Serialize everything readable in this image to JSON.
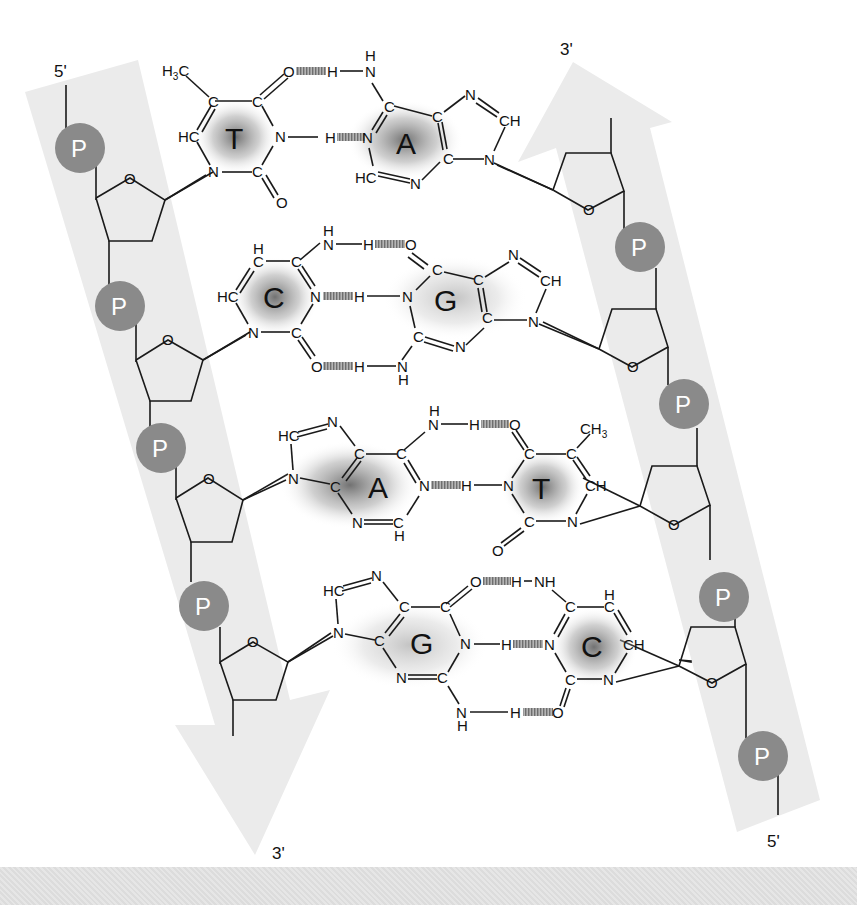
{
  "diagram": {
    "type": "DNA double helix base-pair structure",
    "colors": {
      "strand_band": "#e9e9e9",
      "phosphate": "#8a8a8a",
      "phosphate_text": "#ffffff",
      "bond": "#1a1a1a",
      "hbond": "#9a9a9a",
      "base_shading": "#707070"
    },
    "left_strand": {
      "top_label": "5'",
      "bottom_label": "3'",
      "direction": "down",
      "phosphate_label": "P",
      "phosphates": [
        "P",
        "P",
        "P",
        "P"
      ],
      "sugar_oxygen": "O"
    },
    "right_strand": {
      "top_label": "3'",
      "bottom_label": "5'",
      "direction": "up",
      "phosphate_label": "P",
      "phosphates": [
        "P",
        "P",
        "P",
        "P"
      ],
      "sugar_oxygen": "O"
    },
    "base_pairs": [
      {
        "left": "T",
        "right": "A",
        "left_atoms": {
          "methyl": "H3C",
          "c5": "C",
          "c4": "C",
          "n3": "N",
          "c2": "C",
          "n1": "N",
          "c6": "HC",
          "o4": "O",
          "o2": "O"
        },
        "right_atoms": {
          "n6h": "H",
          "n6": "N",
          "c6": "C",
          "n1": "N",
          "c2": "HC",
          "n3": "N",
          "c4": "C",
          "c5": "C",
          "n7": "N",
          "c8": "CH",
          "n9": "N"
        },
        "hbond_h": [
          "H",
          "H"
        ]
      },
      {
        "left": "C",
        "right": "G",
        "left_atoms": {
          "c5h": "H",
          "c5": "C",
          "c4": "C",
          "n4h": "H",
          "n4": "N",
          "n3": "N",
          "c2": "C",
          "n1": "N",
          "c6": "HC",
          "o2": "O"
        },
        "right_atoms": {
          "o6": "O",
          "c6": "C",
          "n1": "N",
          "c2": "C",
          "n2": "N",
          "n2h": "H",
          "n3": "N",
          "c4": "C",
          "c5": "C",
          "n7": "N",
          "c8": "CH",
          "n9": "N"
        },
        "hbond_h": [
          "H",
          "H",
          "H"
        ]
      },
      {
        "left": "A",
        "right": "T",
        "left_atoms": {
          "c8": "HC",
          "n7": "N",
          "n9": "N",
          "c5": "C",
          "c4": "C",
          "c6": "C",
          "n6": "N",
          "n6h": "H",
          "n1": "N",
          "c2": "C",
          "c2h": "H",
          "n3": "N"
        },
        "right_atoms": {
          "o4": "O",
          "c4": "C",
          "c5": "C",
          "methyl": "CH3",
          "c6": "CH",
          "n1": "N",
          "c2": "C",
          "n3": "N",
          "o2": "O"
        },
        "hbond_h": [
          "H",
          "H"
        ]
      },
      {
        "left": "G",
        "right": "C",
        "left_atoms": {
          "c8": "HC",
          "n7": "N",
          "n9": "N",
          "c5": "C",
          "c4": "C",
          "c6": "C",
          "o6": "O",
          "n1": "N",
          "c2": "C",
          "n3": "N",
          "n2": "N",
          "n2h": "H"
        },
        "right_atoms": {
          "n4": "NH",
          "c4": "C",
          "c5": "C",
          "c5h": "H",
          "c6": "CH",
          "n1": "N",
          "c2": "C",
          "n3": "N",
          "o2": "O"
        },
        "hbond_h": [
          "H",
          "H",
          "H"
        ]
      }
    ]
  }
}
